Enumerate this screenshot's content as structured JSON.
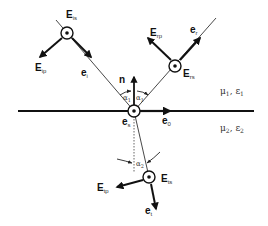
{
  "diagram": {
    "type": "reflection-refraction-interface",
    "colors": {
      "line": "#111111",
      "thin_line": "#333333",
      "text": "#111111",
      "background": "#ffffff"
    },
    "media": {
      "upper": {
        "mu": "μ",
        "mu_sub": "1",
        "sep": ", ",
        "eps": "ε",
        "eps_sub": "1"
      },
      "lower": {
        "mu": "μ",
        "mu_sub": "2",
        "sep": ", ",
        "eps": "ε",
        "eps_sub": "2"
      }
    },
    "labels": {
      "normal": "n",
      "e0": {
        "main": "e",
        "sub": "0"
      },
      "es": {
        "main": "e",
        "sub": "s"
      },
      "ei": {
        "main": "e",
        "sub": "i"
      },
      "er": {
        "main": "e",
        "sub": "r"
      },
      "et": {
        "main": "e",
        "sub": "t"
      },
      "Eis": {
        "main": "E",
        "sub": "is"
      },
      "Eip": {
        "main": "E",
        "sub": "ip"
      },
      "Ers": {
        "main": "E",
        "sub": "rs"
      },
      "Erp": {
        "main": "E",
        "sub": "rp"
      },
      "Ets": {
        "main": "E",
        "sub": "ts"
      },
      "Etp": {
        "main": "E",
        "sub": "tp"
      },
      "alpha1_left": {
        "main": "α",
        "sub": "1"
      },
      "alpha1_right": {
        "main": "α",
        "sub": "1"
      },
      "alpha2": {
        "main": "α",
        "sub": "2"
      }
    }
  }
}
